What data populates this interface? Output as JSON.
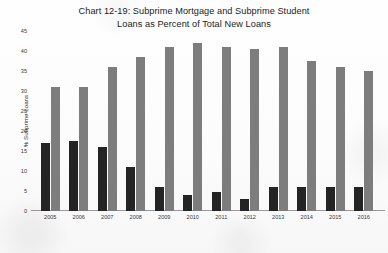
{
  "chart_data": {
    "type": "bar",
    "title": "Chart 12-19: Subprime Mortgage and Subprime Student Loans as Percent of Total New Loans",
    "title_lines": [
      "Chart 12-19: Subprime Mortgage and Subprime Student",
      "Loans as Percent of Total New Loans"
    ],
    "xlabel": "",
    "ylabel": "% Subprime Loans",
    "ylim": [
      0,
      45
    ],
    "ytick_step": 5,
    "yticks": [
      0,
      5,
      10,
      15,
      20,
      25,
      30,
      35,
      40,
      45
    ],
    "grid": false,
    "legend": "none",
    "categories": [
      "2005",
      "2006",
      "2007",
      "2008",
      "2009",
      "2010",
      "2011",
      "2012",
      "2013",
      "2014",
      "2015",
      "2016"
    ],
    "series": [
      {
        "name": "Subprime Mortgage",
        "color": "#242424",
        "values": [
          17,
          17.5,
          16,
          11,
          6,
          4,
          4.7,
          3,
          6,
          6,
          6,
          6
        ]
      },
      {
        "name": "Subprime Student",
        "color": "#7d7d7d",
        "values": [
          31,
          31,
          36,
          38.5,
          41,
          42,
          41,
          40.5,
          41,
          37.5,
          36,
          35
        ]
      }
    ]
  }
}
